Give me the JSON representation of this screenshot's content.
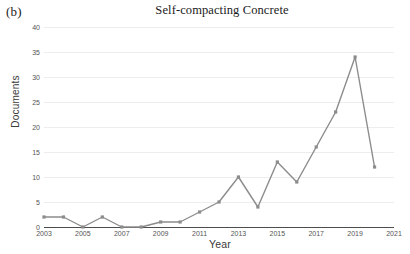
{
  "panel": {
    "label": "(b)"
  },
  "chart_data": {
    "type": "line",
    "title": "Self-compacting Concrete",
    "xlabel": "Year",
    "ylabel": "Documents",
    "x": [
      2003,
      2004,
      2005,
      2006,
      2007,
      2008,
      2009,
      2010,
      2011,
      2012,
      2013,
      2014,
      2015,
      2016,
      2017,
      2018,
      2019,
      2020
    ],
    "values": [
      2,
      2,
      0,
      2,
      0,
      0,
      1,
      1,
      3,
      5,
      10,
      4,
      13,
      9,
      16,
      23,
      34,
      12
    ],
    "series": [
      {
        "name": "Documents",
        "values": [
          2,
          2,
          0,
          2,
          0,
          0,
          1,
          1,
          3,
          5,
          10,
          4,
          13,
          9,
          16,
          23,
          34,
          12
        ]
      }
    ],
    "xlim": [
      2003,
      2021
    ],
    "ylim": [
      0,
      40
    ],
    "ytick_labels": [
      "0",
      "5",
      "10",
      "15",
      "20",
      "25",
      "30",
      "35",
      "40"
    ],
    "ytick_values": [
      0,
      5,
      10,
      15,
      20,
      25,
      30,
      35,
      40
    ],
    "xtick_labels": [
      "2003",
      "2005",
      "2007",
      "2009",
      "2011",
      "2013",
      "2015",
      "2017",
      "2019",
      "2021"
    ],
    "xtick_values": [
      2003,
      2005,
      2007,
      2009,
      2011,
      2013,
      2015,
      2017,
      2019,
      2021
    ],
    "grid": true,
    "legend": "none",
    "line_color": "#8c8c8c",
    "marker": "square",
    "marker_color": "#8c8c8c",
    "grid_color": "#ededed",
    "axis_color": "#4d4d4d"
  }
}
